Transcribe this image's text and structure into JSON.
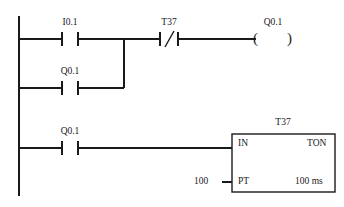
{
  "diagram": {
    "type": "ladder-logic",
    "standard": "LAD",
    "background_color": "#ffffff",
    "line_color": "#1a1a1a"
  },
  "rungs": [
    {
      "id": "rung-1",
      "contacts": [
        {
          "label": "I0.1",
          "kind": "normally-open"
        },
        {
          "label": "T37",
          "kind": "normally-closed"
        }
      ],
      "coil": {
        "label": "Q0.1",
        "kind": "output-coil",
        "open_paren": "(",
        "close_paren": ")"
      }
    },
    {
      "id": "rung-2-branch",
      "contacts": [
        {
          "label": "Q0.1",
          "kind": "normally-open"
        }
      ]
    },
    {
      "id": "rung-3",
      "contacts": [
        {
          "label": "Q0.1",
          "kind": "normally-open"
        }
      ],
      "block": {
        "name": "T37",
        "instruction": "TON",
        "input_label": "IN",
        "preset_label": "PT",
        "preset_value": "100",
        "time_base": "100 ms"
      }
    }
  ],
  "labels": {
    "rung1_contact1": "I0.1",
    "rung1_contact2": "T37",
    "rung1_coil": "Q0.1",
    "rung2_contact1": "Q0.1",
    "rung3_contact1": "Q0.1",
    "timer_name": "T37",
    "timer_in": "IN",
    "timer_ton": "TON",
    "timer_pt": "PT",
    "timer_preset": "100",
    "timer_timebase": "100 ms",
    "coil_open": "(",
    "coil_close": ")"
  }
}
